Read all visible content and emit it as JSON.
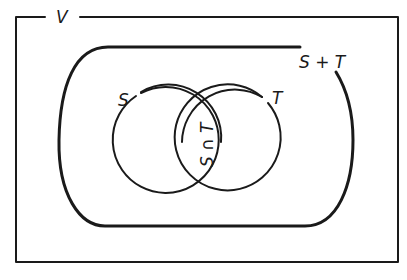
{
  "diagram": {
    "type": "venn",
    "universe": {
      "label": "V"
    },
    "sets": [
      {
        "id": "S",
        "label": "S"
      },
      {
        "id": "T",
        "label": "T"
      }
    ],
    "union": {
      "label": "S + T"
    },
    "intersection": {
      "label": "S ∩ T"
    },
    "colors": {
      "line": "#1a1a1a",
      "background": "#ffffff"
    }
  }
}
